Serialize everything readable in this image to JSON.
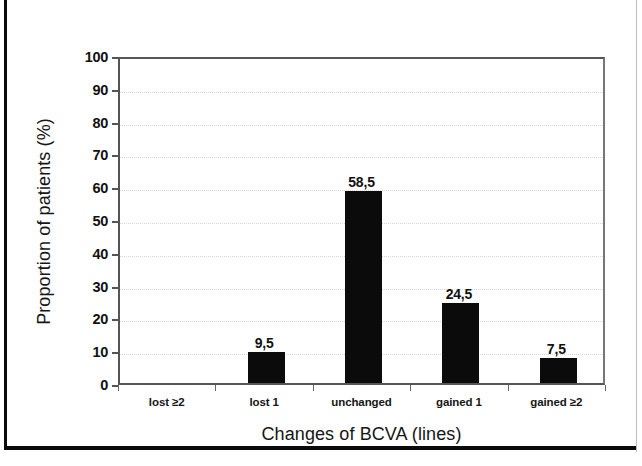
{
  "figure": {
    "border_color": "#0a0a0a",
    "background": "#ffffff",
    "bar_color": "#0b0b0b"
  },
  "chart_data": {
    "type": "bar",
    "title": "",
    "xlabel": "Changes of BCVA (lines)",
    "ylabel": "Proportion of patients (%)",
    "categories": [
      "lost ≥2",
      "lost 1",
      "unchanged",
      "gained 1",
      "gained ≥2"
    ],
    "values": [
      0,
      9.5,
      58.5,
      24.5,
      7.5
    ],
    "data_labels": [
      "",
      "9,5",
      "58,5",
      "24,5",
      "7,5"
    ],
    "ylim": [
      0,
      100
    ],
    "yticks": [
      0,
      10,
      20,
      30,
      40,
      50,
      60,
      70,
      80,
      90,
      100
    ],
    "ytick_labels": [
      "0",
      "10",
      "20",
      "30",
      "40",
      "50",
      "60",
      "70",
      "80",
      "90",
      "100"
    ],
    "grid": true,
    "grid_axis": "y",
    "legend": false,
    "decimal_separator": ","
  }
}
